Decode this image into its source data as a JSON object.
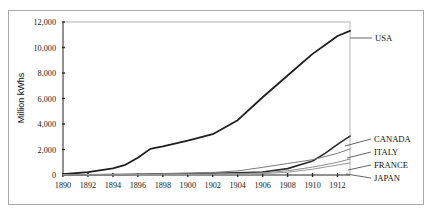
{
  "figure": {
    "width": 433,
    "height": 215,
    "background": "#ffffff",
    "frame_color": "#a8a8a8"
  },
  "chart_data": {
    "type": "line",
    "title": "",
    "xlabel": "",
    "ylabel": "Million kWhs",
    "xlim": [
      1890,
      1913
    ],
    "ylim": [
      0,
      12000
    ],
    "grid": false,
    "legend_position": "right-inline-labels",
    "xticks": [
      1890,
      1892,
      1894,
      1896,
      1898,
      1900,
      1902,
      1904,
      1906,
      1908,
      1910,
      1912
    ],
    "xtick_labels": [
      "1890",
      "1892",
      "1894",
      "1896",
      "1898",
      "1900",
      "1902",
      "1904",
      "1906",
      "1908",
      "1910",
      "1912"
    ],
    "yticks": [
      0,
      2000,
      4000,
      6000,
      8000,
      10000,
      12000
    ],
    "ytick_labels": [
      "0",
      "2,000",
      "4,000",
      "6,000",
      "8,000",
      "10,000",
      "12,000"
    ],
    "x": [
      1890,
      1892,
      1894,
      1895,
      1896,
      1897,
      1898,
      1900,
      1902,
      1904,
      1906,
      1908,
      1910,
      1911,
      1912,
      1913
    ],
    "series": [
      {
        "name": "USA",
        "label": "USA",
        "color": "#1f1f1f",
        "width": 1.8,
        "values": [
          60,
          220,
          520,
          800,
          1350,
          2050,
          2250,
          2700,
          3200,
          4300,
          6100,
          7800,
          9500,
          10200,
          10900,
          11300
        ]
      },
      {
        "name": "CANADA",
        "label": "CANADA",
        "color": "#2b2b2b",
        "width": 1.6,
        "values": [
          10,
          20,
          35,
          45,
          55,
          70,
          85,
          110,
          140,
          180,
          240,
          500,
          1100,
          1700,
          2400,
          3050
        ]
      },
      {
        "name": "ITALY",
        "label": "ITALY",
        "color": "#7a7a7a",
        "width": 1.0,
        "values": [
          15,
          30,
          45,
          55,
          70,
          85,
          100,
          140,
          200,
          320,
          600,
          900,
          1200,
          1450,
          1700,
          2050
        ]
      },
      {
        "name": "FRANCE",
        "label": "FRANCE",
        "color": "#8c8c8c",
        "width": 1.0,
        "values": [
          8,
          14,
          20,
          25,
          30,
          38,
          46,
          60,
          80,
          110,
          160,
          330,
          620,
          800,
          1000,
          1250
        ]
      },
      {
        "name": "JAPAN",
        "label": "JAPAN",
        "color": "#9a9a9a",
        "width": 1.0,
        "values": [
          3,
          6,
          10,
          13,
          16,
          20,
          26,
          36,
          50,
          70,
          105,
          220,
          450,
          620,
          780,
          950
        ]
      }
    ],
    "annotations": [
      {
        "name": "USA",
        "text": "USA"
      },
      {
        "name": "CANADA",
        "text": "CANADA"
      },
      {
        "name": "ITALY",
        "text": "ITALY"
      },
      {
        "name": "FRANCE",
        "text": "FRANCE"
      },
      {
        "name": "JAPAN",
        "text": "JAPAN"
      }
    ]
  },
  "labels": {
    "y_axis_title": "Million kWhs",
    "usa": "USA",
    "canada": "CANADA",
    "italy": "ITALY",
    "france": "FRANCE",
    "japan": "JAPAN"
  }
}
